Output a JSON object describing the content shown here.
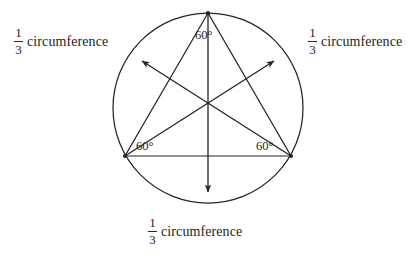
{
  "figure": {
    "background_color": "#ffffff",
    "stroke_color": "#242424",
    "text_color": "#242424"
  },
  "circle": {
    "center_x": 208,
    "center_y": 108,
    "radius": 95
  },
  "triangle": {
    "vertices": [
      {
        "name": "top",
        "x": 208,
        "y": 13
      },
      {
        "name": "bottom-left",
        "x": 125,
        "y": 156
      },
      {
        "name": "bottom-right",
        "x": 291,
        "y": 156
      }
    ]
  },
  "arrows": [
    {
      "name": "arrow-from-top-vertex",
      "from_x": 208,
      "from_y": 13,
      "to_x": 208,
      "to_y": 192
    },
    {
      "name": "arrow-from-bottom-left-vertex",
      "from_x": 125,
      "from_y": 156,
      "to_x": 274,
      "to_y": 61
    },
    {
      "name": "arrow-from-bottom-right-vertex",
      "from_x": 291,
      "from_y": 156,
      "to_x": 142,
      "to_y": 61
    }
  ],
  "angle_labels": [
    {
      "name": "angle-top",
      "value": "60°"
    },
    {
      "name": "angle-bottom-left",
      "value": "60°"
    },
    {
      "name": "angle-bottom-right",
      "value": "60°"
    }
  ],
  "captions": [
    {
      "name": "caption-left",
      "numerator": "1",
      "denominator": "3",
      "text": "circumference"
    },
    {
      "name": "caption-right",
      "numerator": "1",
      "denominator": "3",
      "text": "circumference"
    },
    {
      "name": "caption-bottom",
      "numerator": "1",
      "denominator": "3",
      "text": "circumference"
    }
  ]
}
